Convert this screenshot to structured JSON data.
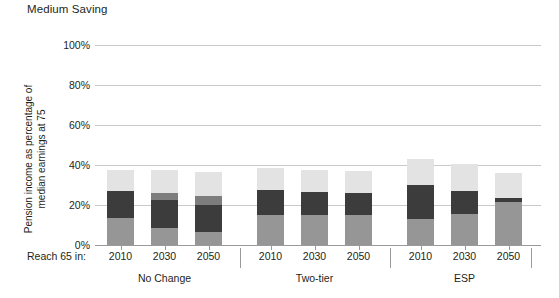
{
  "chart_data": {
    "type": "bar",
    "title": "Medium Saving",
    "xlabel": "Reach 65 in:",
    "ylabel": "Pension income as percentage of median earnings at 75",
    "ylim": [
      0,
      100
    ],
    "yticks": [
      0,
      20,
      40,
      60,
      80,
      100
    ],
    "ytick_labels": [
      "0%",
      "20%",
      "40%",
      "60%",
      "80%",
      "100%"
    ],
    "grid": true,
    "stacked": true,
    "legend": "none",
    "categories": [
      "2010",
      "2030",
      "2050",
      "2010",
      "2030",
      "2050",
      "2010",
      "2030",
      "2050"
    ],
    "groups": [
      {
        "label": "No Change",
        "categories": [
          "2010",
          "2030",
          "2050"
        ]
      },
      {
        "label": "Two-tier",
        "categories": [
          "2010",
          "2030",
          "2050"
        ]
      },
      {
        "label": "ESP",
        "categories": [
          "2010",
          "2030",
          "2050"
        ]
      }
    ],
    "series": [
      {
        "name": "segment-bottom",
        "color": "#969696",
        "values": [
          13.5,
          8.5,
          6.5,
          15.0,
          15.0,
          15.0,
          13.0,
          15.5,
          21.5
        ]
      },
      {
        "name": "segment-dark",
        "color": "#3c3c3c",
        "values": [
          13.5,
          14.0,
          13.5,
          12.5,
          11.5,
          11.0,
          17.0,
          11.5,
          2.0
        ]
      },
      {
        "name": "segment-mid",
        "color": "#7d7d7d",
        "values": [
          0.0,
          3.5,
          4.5,
          0.0,
          0.0,
          0.0,
          0.0,
          0.0,
          0.0
        ]
      },
      {
        "name": "segment-top",
        "color": "#e3e3e3",
        "values": [
          10.5,
          11.5,
          12.0,
          11.0,
          11.0,
          11.0,
          13.0,
          13.5,
          12.5
        ]
      }
    ],
    "totals": [
      37.5,
      37.5,
      36.5,
      38.5,
      37.5,
      37.0,
      43.0,
      40.5,
      36.0
    ]
  }
}
